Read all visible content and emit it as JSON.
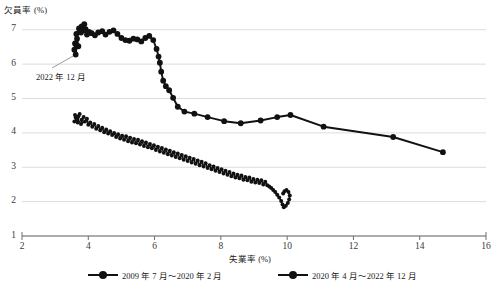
{
  "chart_data": {
    "type": "scatter",
    "title": "",
    "xlabel": "失業率 (%)",
    "ylabel": "欠員率 (%)",
    "xlim": [
      2,
      16
    ],
    "ylim": [
      1,
      7.4
    ],
    "xticks": [
      2,
      4,
      6,
      8,
      10,
      12,
      14,
      16
    ],
    "yticks": [
      1,
      2,
      3,
      4,
      5,
      6,
      7
    ],
    "grid": "horizontal",
    "legend_position": "bottom",
    "annotations": [
      {
        "text": "2022 年 12 月",
        "x": 3.62,
        "y": 6.28
      }
    ],
    "series": [
      {
        "name": "2009 年 7 月～2020 年 2 月",
        "color": "#111111",
        "marker": "circle-small",
        "points": [
          [
            3.62,
            4.45
          ],
          [
            3.6,
            4.52
          ],
          [
            3.66,
            4.4
          ],
          [
            3.58,
            4.33
          ],
          [
            3.7,
            4.48
          ],
          [
            3.74,
            4.55
          ],
          [
            3.68,
            4.3
          ],
          [
            3.8,
            4.38
          ],
          [
            3.86,
            4.46
          ],
          [
            3.78,
            4.26
          ],
          [
            3.9,
            4.33
          ],
          [
            3.96,
            4.41
          ],
          [
            4.0,
            4.24
          ],
          [
            4.06,
            4.3
          ],
          [
            4.12,
            4.18
          ],
          [
            4.18,
            4.26
          ],
          [
            4.24,
            4.12
          ],
          [
            4.3,
            4.2
          ],
          [
            4.36,
            4.08
          ],
          [
            4.42,
            4.15
          ],
          [
            4.48,
            4.02
          ],
          [
            4.54,
            4.1
          ],
          [
            4.6,
            3.98
          ],
          [
            4.66,
            4.05
          ],
          [
            4.72,
            3.94
          ],
          [
            4.78,
            4.0
          ],
          [
            4.84,
            3.88
          ],
          [
            4.9,
            3.96
          ],
          [
            4.96,
            3.84
          ],
          [
            5.02,
            3.92
          ],
          [
            5.08,
            3.8
          ],
          [
            5.14,
            3.9
          ],
          [
            5.2,
            3.76
          ],
          [
            5.26,
            3.86
          ],
          [
            5.32,
            3.72
          ],
          [
            5.38,
            3.82
          ],
          [
            5.44,
            3.7
          ],
          [
            5.5,
            3.8
          ],
          [
            5.56,
            3.66
          ],
          [
            5.62,
            3.76
          ],
          [
            5.68,
            3.62
          ],
          [
            5.74,
            3.72
          ],
          [
            5.8,
            3.58
          ],
          [
            5.86,
            3.68
          ],
          [
            5.92,
            3.55
          ],
          [
            5.98,
            3.64
          ],
          [
            6.04,
            3.5
          ],
          [
            6.1,
            3.6
          ],
          [
            6.16,
            3.46
          ],
          [
            6.22,
            3.56
          ],
          [
            6.28,
            3.42
          ],
          [
            6.34,
            3.52
          ],
          [
            6.4,
            3.38
          ],
          [
            6.46,
            3.48
          ],
          [
            6.52,
            3.34
          ],
          [
            6.58,
            3.44
          ],
          [
            6.64,
            3.3
          ],
          [
            6.7,
            3.4
          ],
          [
            6.76,
            3.26
          ],
          [
            6.82,
            3.36
          ],
          [
            6.88,
            3.22
          ],
          [
            6.94,
            3.32
          ],
          [
            7.0,
            3.18
          ],
          [
            7.06,
            3.28
          ],
          [
            7.12,
            3.14
          ],
          [
            7.18,
            3.24
          ],
          [
            7.24,
            3.1
          ],
          [
            7.3,
            3.2
          ],
          [
            7.36,
            3.06
          ],
          [
            7.42,
            3.16
          ],
          [
            7.48,
            3.02
          ],
          [
            7.54,
            3.12
          ],
          [
            7.6,
            2.98
          ],
          [
            7.66,
            3.06
          ],
          [
            7.72,
            2.94
          ],
          [
            7.78,
            3.02
          ],
          [
            7.84,
            2.9
          ],
          [
            7.9,
            2.98
          ],
          [
            7.96,
            2.86
          ],
          [
            8.02,
            2.94
          ],
          [
            8.08,
            2.82
          ],
          [
            8.14,
            2.9
          ],
          [
            8.2,
            2.78
          ],
          [
            8.26,
            2.86
          ],
          [
            8.32,
            2.74
          ],
          [
            8.38,
            2.82
          ],
          [
            8.44,
            2.7
          ],
          [
            8.5,
            2.78
          ],
          [
            8.56,
            2.68
          ],
          [
            8.62,
            2.76
          ],
          [
            8.68,
            2.64
          ],
          [
            8.74,
            2.72
          ],
          [
            8.8,
            2.62
          ],
          [
            8.86,
            2.7
          ],
          [
            8.92,
            2.58
          ],
          [
            8.98,
            2.66
          ],
          [
            9.04,
            2.56
          ],
          [
            9.1,
            2.64
          ],
          [
            9.16,
            2.54
          ],
          [
            9.22,
            2.62
          ],
          [
            9.28,
            2.5
          ],
          [
            9.34,
            2.58
          ],
          [
            9.4,
            2.48
          ],
          [
            9.46,
            2.44
          ],
          [
            9.52,
            2.4
          ],
          [
            9.58,
            2.34
          ],
          [
            9.64,
            2.28
          ],
          [
            9.7,
            2.2
          ],
          [
            9.76,
            2.12
          ],
          [
            9.82,
            2.02
          ],
          [
            9.86,
            1.92
          ],
          [
            9.9,
            1.84
          ],
          [
            9.96,
            1.88
          ],
          [
            10.02,
            1.96
          ],
          [
            10.06,
            2.06
          ],
          [
            10.08,
            2.18
          ],
          [
            10.04,
            2.28
          ],
          [
            9.98,
            2.34
          ],
          [
            9.92,
            2.3
          ],
          [
            9.88,
            2.24
          ]
        ]
      },
      {
        "name": "2020 年 4 月～2022 年 12 月",
        "color": "#111111",
        "marker": "circle-large",
        "points": [
          [
            3.58,
            6.42
          ],
          [
            3.6,
            6.6
          ],
          [
            3.62,
            6.28
          ],
          [
            3.66,
            6.74
          ],
          [
            3.7,
            6.52
          ],
          [
            3.64,
            6.88
          ],
          [
            3.72,
            7.04
          ],
          [
            3.78,
            6.92
          ],
          [
            3.8,
            7.1
          ],
          [
            3.84,
            6.98
          ],
          [
            3.88,
            7.16
          ],
          [
            3.92,
            7.02
          ],
          [
            3.96,
            6.86
          ],
          [
            4.02,
            6.94
          ],
          [
            4.1,
            6.9
          ],
          [
            4.2,
            6.84
          ],
          [
            4.3,
            6.92
          ],
          [
            4.42,
            6.96
          ],
          [
            4.52,
            6.86
          ],
          [
            4.64,
            6.94
          ],
          [
            4.76,
            6.98
          ],
          [
            4.88,
            6.88
          ],
          [
            5.0,
            6.76
          ],
          [
            5.12,
            6.7
          ],
          [
            5.24,
            6.68
          ],
          [
            5.36,
            6.74
          ],
          [
            5.48,
            6.72
          ],
          [
            5.6,
            6.66
          ],
          [
            5.72,
            6.76
          ],
          [
            5.84,
            6.82
          ],
          [
            5.96,
            6.7
          ],
          [
            6.06,
            6.44
          ],
          [
            6.12,
            6.22
          ],
          [
            6.16,
            6.04
          ],
          [
            6.2,
            5.78
          ],
          [
            6.26,
            5.52
          ],
          [
            6.34,
            5.36
          ],
          [
            6.44,
            5.24
          ],
          [
            6.56,
            5.02
          ],
          [
            6.7,
            4.76
          ],
          [
            6.9,
            4.62
          ],
          [
            7.2,
            4.56
          ],
          [
            7.6,
            4.46
          ],
          [
            8.1,
            4.34
          ],
          [
            8.6,
            4.28
          ],
          [
            9.2,
            4.36
          ],
          [
            9.7,
            4.46
          ],
          [
            10.1,
            4.52
          ],
          [
            11.1,
            4.18
          ],
          [
            13.2,
            3.88
          ],
          [
            14.7,
            3.44
          ]
        ]
      }
    ]
  },
  "source": {
    "text": ""
  }
}
